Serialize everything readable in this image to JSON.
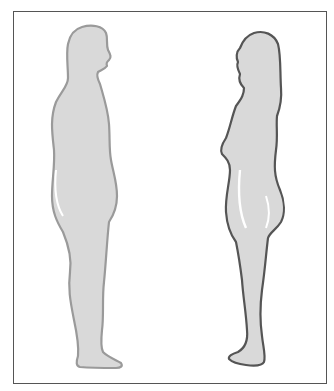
{
  "illustration": {
    "frame": {
      "border_color": "#555555"
    },
    "figures": [
      {
        "name": "male-silhouette",
        "facing": "right",
        "fill": "#d9d9d9",
        "outline": "#9a9a9a"
      },
      {
        "name": "female-silhouette",
        "facing": "left",
        "fill": "#d9d9d9",
        "outline": "#555555"
      }
    ]
  }
}
